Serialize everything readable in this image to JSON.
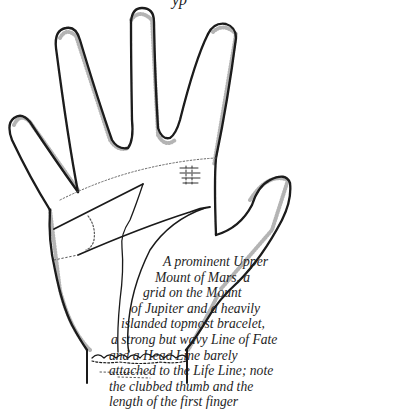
{
  "figure": {
    "top_text_fragment": "yp",
    "labels": {
      "fingers": [
        "little finger",
        "ring finger",
        "middle finger",
        "first finger"
      ],
      "thumb": "clubbed thumb",
      "lines": [
        "Head Line",
        "Life Line",
        "Line of Fate",
        "Heart Line"
      ],
      "markings": [
        "grid on Mount of Jupiter",
        "islanded topmost bracelet"
      ]
    },
    "caption_lines": [
      "A prominent Upper",
      "Mount of Mars, a",
      "grid on the Mount",
      "of Jupiter and a heavily",
      "islanded topmost bracelet,",
      "a strong but wavy Line of Fate",
      "and a Head Line barely",
      "attached to the Life Line; note",
      "the clubbed thumb and the",
      "length of the first finger"
    ],
    "colors": {
      "ink": "#1a1a1a",
      "stipple": "#555555",
      "paper": "#ffffff"
    }
  }
}
